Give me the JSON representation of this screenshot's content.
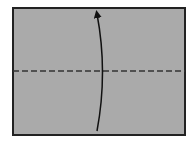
{
  "diagram": {
    "type": "origami-fold-step",
    "paper": {
      "fill": "#aaaaaa",
      "stroke": "#222222",
      "x": 13,
      "y": 8,
      "width": 172,
      "height": 127
    },
    "fold_line": {
      "style": "valley-dashed",
      "y": 71,
      "color": "#333333"
    },
    "arrow": {
      "direction": "up",
      "color": "#111111",
      "description": "fold bottom half up to top"
    }
  }
}
